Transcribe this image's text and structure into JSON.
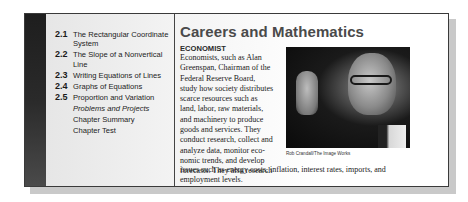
{
  "toc": {
    "items": [
      {
        "number": "2.1",
        "label": "The Rectangular Coordinate System"
      },
      {
        "number": "2.2",
        "label": "The Slope of a Nonvertical Line"
      },
      {
        "number": "2.3",
        "label": "Writing Equations of Lines"
      },
      {
        "number": "2.4",
        "label": "Graphs of Equations"
      },
      {
        "number": "2.5",
        "label": "Proportion and Variation"
      }
    ],
    "extras": [
      {
        "label": "Problems and Projects",
        "italic": true
      },
      {
        "label": "Chapter Summary"
      },
      {
        "label": "Chapter Test"
      }
    ]
  },
  "feature": {
    "title": "Careers and Mathematics",
    "subhead": "ECONOMIST",
    "body_lines": [
      "Economists, such as Alan",
      "Greenspan, Chairman of the",
      "Federal Reserve Board,",
      "study how society distributes",
      "scarce resources such as",
      "land, labor, raw materials,",
      "and machinery to produce",
      "goods and services. They",
      "conduct research, collect and",
      "analyze data, monitor eco-",
      "nomic trends, and develop",
      "forecasts. They also research"
    ],
    "body_wide_lines": [
      "issues such as energy costs, inflation, interest rates, imports, and",
      "employment levels."
    ],
    "photo": {
      "alt": "Alan Greenspan gesturing",
      "credit": "Rob Crandall/The Image Works"
    }
  }
}
